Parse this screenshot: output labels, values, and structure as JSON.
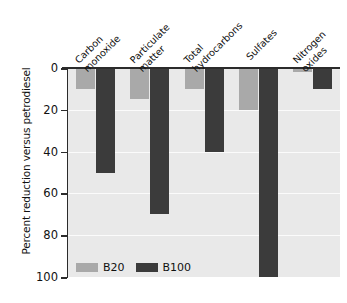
{
  "chart_data": {
    "type": "bar",
    "title": "",
    "subtitle": "",
    "xlabel": "",
    "ylabel": "Percent reduction versus petrodiesel",
    "categories": [
      "Carbon monoxide",
      "Particulate matter",
      "Total hydrocarbons",
      "Sulfates",
      "Nitrogen oxides"
    ],
    "category_lines": [
      [
        "Carbon",
        "monoxide"
      ],
      [
        "Particulate",
        "matter"
      ],
      [
        "Total",
        "hydrocarbons"
      ],
      [
        "Sulfates",
        ""
      ],
      [
        "Nitrogen",
        "oxides"
      ]
    ],
    "series": [
      {
        "name": "B20",
        "color": "#a9a9a9",
        "values": [
          10,
          15,
          10,
          20,
          2
        ]
      },
      {
        "name": "B100",
        "color": "#3b3b3b",
        "values": [
          50,
          70,
          40,
          100,
          10
        ]
      }
    ],
    "ylim": [
      0,
      100
    ],
    "y_inverted": true,
    "yticks": [
      0,
      20,
      40,
      60,
      80,
      100
    ],
    "ytick_labels": [
      "0",
      "20",
      "40",
      "60",
      "80",
      "100"
    ],
    "grid": true,
    "grid_color": "#fbfbfb",
    "plot_background": "#e9e9e9",
    "legend_position": "inside-bottom-left",
    "xtick_label_rotation": 45,
    "bar_orientation": "downward-from-zero"
  },
  "legend": {
    "entries": [
      {
        "label": "B20"
      },
      {
        "label": "B100"
      }
    ]
  }
}
